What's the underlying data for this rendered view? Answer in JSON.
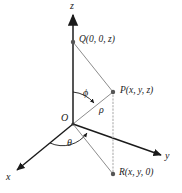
{
  "figure": {
    "background_color": "#ffffff",
    "axis_color": "#1a1a1a",
    "ray_color": "#8c8c8c",
    "dotted_color": "#b3b3b3",
    "dot_color": "#555555"
  },
  "axes": [
    {
      "id": "z-axis",
      "label": "z",
      "label_x": 70,
      "label_y": 1
    },
    {
      "id": "y-axis",
      "label": "y",
      "label_x": 165,
      "label_y": 151
    },
    {
      "id": "x-axis",
      "label": "x",
      "label_x": 6,
      "label_y": 172
    }
  ],
  "points": [
    {
      "id": "origin",
      "label": "O",
      "label_x": 61,
      "label_y": 113,
      "dot_x": 73,
      "dot_y": 124
    },
    {
      "id": "point-q",
      "label": "Q(0, 0, z)",
      "label_x": 79,
      "label_y": 35,
      "dot_x": 73,
      "dot_y": 42
    },
    {
      "id": "point-p",
      "label": "P(x, y, z)",
      "label_x": 120,
      "label_y": 86,
      "dot_x": 113,
      "dot_y": 92
    },
    {
      "id": "point-r",
      "label": "R(x, y, 0)",
      "label_x": 119,
      "label_y": 168,
      "dot_x": 113,
      "dot_y": 174
    }
  ],
  "angles": [
    {
      "id": "phi",
      "label": "ϕ",
      "label_x": 83,
      "label_y": 88,
      "description": "angle from positive z-axis to ray OP"
    },
    {
      "id": "theta",
      "label": "θ",
      "label_x": 67,
      "label_y": 138,
      "description": "angle from positive x-axis to ray OR in the xy-plane"
    }
  ],
  "segments": [
    {
      "id": "rho",
      "label": "ρ",
      "label_x": 99,
      "label_y": 105,
      "description": "distance from origin O to point P"
    }
  ]
}
